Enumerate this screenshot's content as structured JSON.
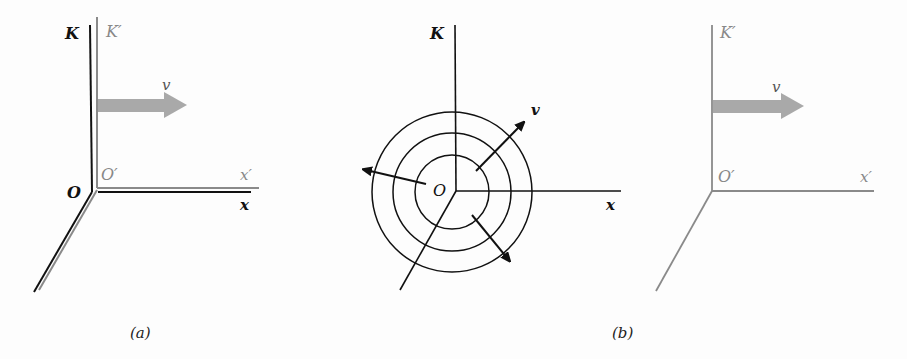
{
  "panels": {
    "a": {
      "caption": "(a)",
      "frame_K_label": "K",
      "frame_K_prime_label": "K′",
      "origin_label": "O",
      "origin_prime_label": "O′",
      "x_label": "x",
      "x_prime_label": "x′",
      "velocity_label": "v"
    },
    "b": {
      "caption": "(b)",
      "frame_K_label": "K",
      "origin_label": "O",
      "x_label": "x",
      "velocity_label": "v",
      "wavefront_count": 3,
      "frame_K_prime_label": "K′",
      "origin_prime_label": "O′",
      "x_prime_label": "x′",
      "moving_velocity_label": "v"
    }
  },
  "colors": {
    "black_frame": "#111111",
    "gray_frame": "#8a8a8a",
    "velocity_arrow": "#a9a9a9"
  }
}
